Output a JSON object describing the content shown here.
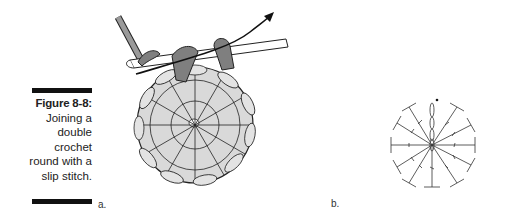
{
  "figure": {
    "number": "Figure 8-8:",
    "caption_lines": [
      "Joining a",
      "double",
      "crochet",
      "round with a",
      "slip stitch."
    ]
  },
  "panels": {
    "a": {
      "label": "a.",
      "description": "Illustration of crochet hook inserted into top of starting chain, yarn pulled through to join round of double crochet stitches"
    },
    "b": {
      "label": "b.",
      "description": "Symbol chart: chain-3 turning chain plus 11 double crochet stitches radiating from center ring, slip stitch dot at top"
    }
  },
  "colors": {
    "yarn_light": "#d9d9d9",
    "yarn_dark": "#7f7f7f",
    "outline": "#222222",
    "hook": "#9a9a9a",
    "symbol": "#333333"
  }
}
